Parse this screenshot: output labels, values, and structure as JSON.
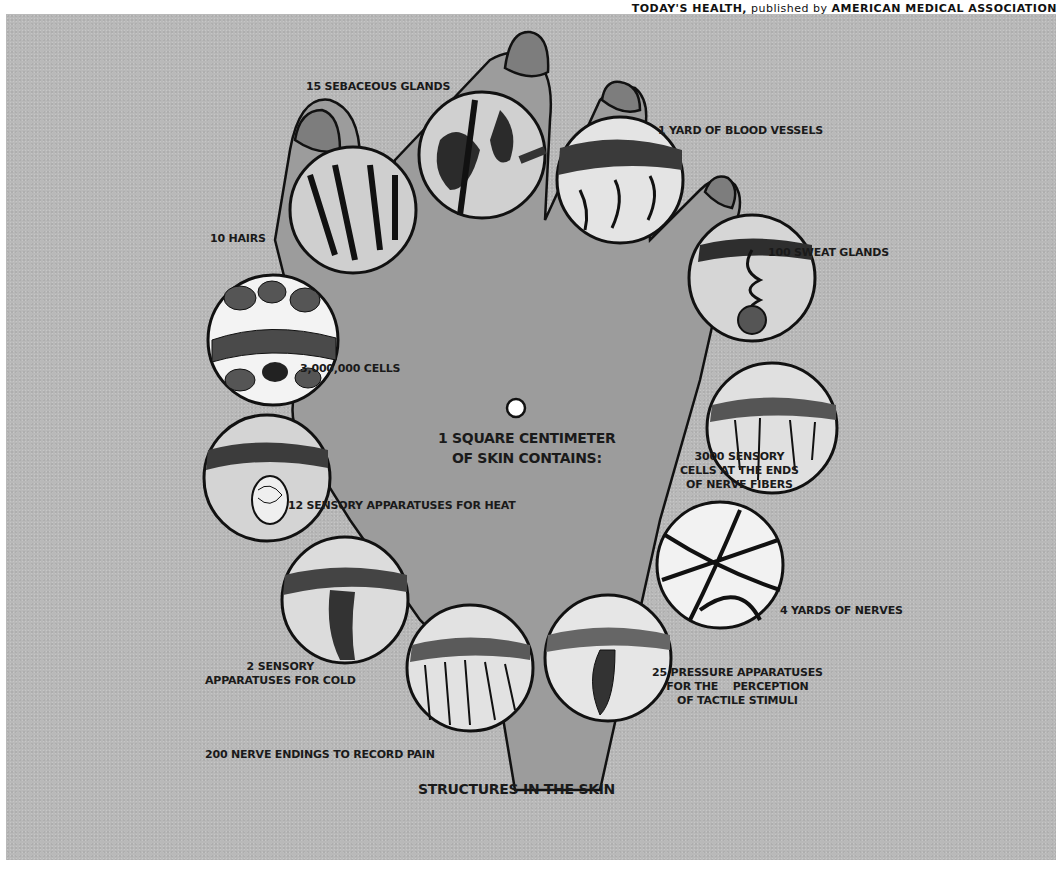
{
  "header": {
    "credit_prefix": "TODAY'S HEALTH,",
    "credit_middle": " published by ",
    "credit_suffix": "AMERICAN MEDICAL ASSOCIATION"
  },
  "diagram": {
    "center_title_line1": "1 SQUARE CENTIMETER",
    "center_title_line2": "OF SKIN CONTAINS:",
    "caption": "STRUCTURES IN THE SKIN",
    "colors": {
      "background": "#b9b9b9",
      "hand": "#9a9a9a",
      "outline": "#111111",
      "circle_fill": "#e6e6e6"
    },
    "labels": [
      {
        "id": "sebaceous",
        "text": "15 SEBACEOUS GLANDS"
      },
      {
        "id": "blood",
        "text": "1 YARD OF BLOOD VESSELS"
      },
      {
        "id": "sweat",
        "text": "100 SWEAT GLANDS"
      },
      {
        "id": "hairs",
        "text": "10 HAIRS"
      },
      {
        "id": "cells",
        "text": "3,000,000 CELLS"
      },
      {
        "id": "sensory_line1",
        "text": "3000 SENSORY"
      },
      {
        "id": "sensory_line2",
        "text": "CELLS AT THE ENDS"
      },
      {
        "id": "sensory_line3",
        "text": "OF NERVE FIBERS"
      },
      {
        "id": "heat",
        "text": "12 SENSORY APPARATUSES FOR HEAT"
      },
      {
        "id": "nerves",
        "text": "4 YARDS OF NERVES"
      },
      {
        "id": "cold_line1",
        "text": "2 SENSORY"
      },
      {
        "id": "cold_line2",
        "text": "APPARATUSES FOR COLD"
      },
      {
        "id": "pressure_line1",
        "text": "25 PRESSURE APPARATUSES"
      },
      {
        "id": "pressure_line2",
        "text": "FOR THE    PERCEPTION"
      },
      {
        "id": "pressure_line3",
        "text": "OF TACTILE STIMULI"
      },
      {
        "id": "pain",
        "text": "200 NERVE ENDINGS TO RECORD PAIN"
      }
    ]
  }
}
